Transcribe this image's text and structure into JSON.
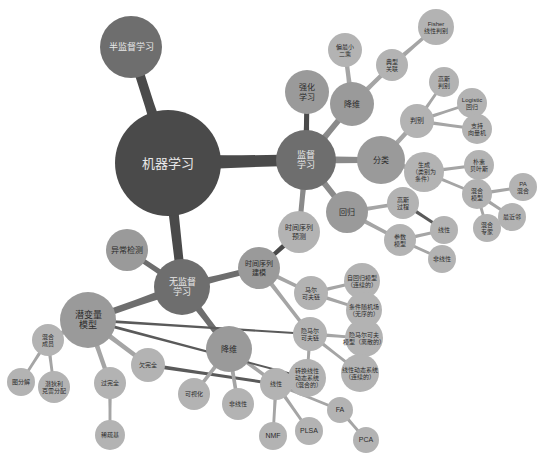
{
  "diagram": {
    "type": "mind-map",
    "title": "机器学习",
    "colors": {
      "background": "#ffffff",
      "root_fill": "#4a4a4a",
      "level1_fill": "#6e6e6e",
      "level2_fill": "#9a9a9a",
      "level3_fill": "#b3b3b3",
      "leaf_fill": "#bdbdbd",
      "link_dark": "#4a4a4a",
      "link_mid": "#8a8a8a",
      "link_light": "#b3b3b3",
      "label_dark": "#2b2b2b",
      "label_light": "#e8e8e8"
    },
    "nodes": [
      {
        "id": "ml",
        "label": "机器学习",
        "x": 168,
        "y": 163,
        "r": 53,
        "fill": "#4a4a4a",
        "text": "#e8e8e8",
        "fontsize": 13,
        "lines": [
          "机器学习"
        ]
      },
      {
        "id": "semi",
        "label": "半监督学习",
        "x": 131,
        "y": 47,
        "r": 31,
        "fill": "#6e6e6e",
        "text": "#e8e8e8",
        "fontsize": 9,
        "lines": [
          "半监督学习"
        ]
      },
      {
        "id": "sup",
        "label": "监督学习",
        "x": 306,
        "y": 160,
        "r": 30,
        "fill": "#6e6e6e",
        "text": "#e8e8e8",
        "fontsize": 9,
        "lines": [
          "监督",
          "学习"
        ]
      },
      {
        "id": "unsup",
        "label": "无监督学习",
        "x": 182,
        "y": 287,
        "r": 28,
        "fill": "#6e6e6e",
        "text": "#e8e8e8",
        "fontsize": 9,
        "lines": [
          "无监督",
          "学习"
        ]
      },
      {
        "id": "rl",
        "label": "强化学习",
        "x": 307,
        "y": 92,
        "r": 22,
        "fill": "#9a9a9a",
        "text": "#2b2b2b",
        "fontsize": 8,
        "lines": [
          "强化",
          "学习"
        ]
      },
      {
        "id": "anomaly",
        "label": "异常检测",
        "x": 127,
        "y": 250,
        "r": 21,
        "fill": "#9a9a9a",
        "text": "#2b2b2b",
        "fontsize": 8,
        "lines": [
          "异常检测"
        ]
      },
      {
        "id": "latent",
        "label": "潜变量模型",
        "x": 88,
        "y": 320,
        "r": 28,
        "fill": "#9a9a9a",
        "text": "#2b2b2b",
        "fontsize": 9,
        "lines": [
          "潜变量",
          "模型"
        ]
      },
      {
        "id": "dimred_sup",
        "label": "降维",
        "x": 352,
        "y": 104,
        "r": 22,
        "fill": "#9a9a9a",
        "text": "#2b2b2b",
        "fontsize": 8,
        "lines": [
          "降维"
        ]
      },
      {
        "id": "classify",
        "label": "分类",
        "x": 381,
        "y": 160,
        "r": 24,
        "fill": "#9a9a9a",
        "text": "#2b2b2b",
        "fontsize": 8,
        "lines": [
          "分类"
        ]
      },
      {
        "id": "regress",
        "label": "回归",
        "x": 347,
        "y": 212,
        "r": 21,
        "fill": "#9a9a9a",
        "text": "#2b2b2b",
        "fontsize": 8,
        "lines": [
          "回归"
        ]
      },
      {
        "id": "tsmodel",
        "label": "时间序列建模",
        "x": 259,
        "y": 268,
        "r": 21,
        "fill": "#9a9a9a",
        "text": "#2b2b2b",
        "fontsize": 7,
        "lines": [
          "时间序列",
          "建模"
        ]
      },
      {
        "id": "tsforecast",
        "label": "时间序列预测",
        "x": 299,
        "y": 232,
        "r": 21,
        "fill": "#b3b3b3",
        "text": "#2b2b2b",
        "fontsize": 7,
        "lines": [
          "时间序列",
          "预测"
        ]
      },
      {
        "id": "dimred_un",
        "label": "降维",
        "x": 229,
        "y": 349,
        "r": 23,
        "fill": "#9a9a9a",
        "text": "#2b2b2b",
        "fontsize": 8,
        "lines": [
          "降维"
        ]
      },
      {
        "id": "pls",
        "label": "偏最小二乘",
        "x": 345,
        "y": 50,
        "r": 17,
        "fill": "#b3b3b3",
        "text": "#2b2b2b",
        "fontsize": 6,
        "lines": [
          "偏最小",
          "二乘"
        ]
      },
      {
        "id": "cca",
        "label": "典型关联",
        "x": 392,
        "y": 65,
        "r": 16,
        "fill": "#b3b3b3",
        "text": "#2b2b2b",
        "fontsize": 6,
        "lines": [
          "典型",
          "关联"
        ]
      },
      {
        "id": "fisher",
        "label": "Fisher线性判别",
        "x": 436,
        "y": 27,
        "r": 18,
        "fill": "#b3b3b3",
        "text": "#2b2b2b",
        "fontsize": 6,
        "lines": [
          "Fisher",
          "线性判别"
        ]
      },
      {
        "id": "discrim",
        "label": "判别",
        "x": 417,
        "y": 121,
        "r": 17,
        "fill": "#b3b3b3",
        "text": "#2b2b2b",
        "fontsize": 7,
        "lines": [
          "判别"
        ]
      },
      {
        "id": "gauss_disc",
        "label": "高斯判别",
        "x": 444,
        "y": 82,
        "r": 15,
        "fill": "#b3b3b3",
        "text": "#2b2b2b",
        "fontsize": 6,
        "lines": [
          "高斯",
          "判别"
        ]
      },
      {
        "id": "logistic",
        "label": "Logistic回归",
        "x": 472,
        "y": 103,
        "r": 15,
        "fill": "#b3b3b3",
        "text": "#2b2b2b",
        "fontsize": 6,
        "lines": [
          "Logistic",
          "回归"
        ]
      },
      {
        "id": "svm",
        "label": "支持向量机",
        "x": 477,
        "y": 129,
        "r": 15,
        "fill": "#b3b3b3",
        "text": "#2b2b2b",
        "fontsize": 6,
        "lines": [
          "支持",
          "向量机"
        ]
      },
      {
        "id": "generate",
        "label": "生成(类别为条件)",
        "x": 424,
        "y": 172,
        "r": 20,
        "fill": "#b3b3b3",
        "text": "#2b2b2b",
        "fontsize": 6,
        "lines": [
          "生成",
          "（类别为",
          "条件）"
        ]
      },
      {
        "id": "naivebayes",
        "label": "朴素贝叶斯",
        "x": 479,
        "y": 165,
        "r": 15,
        "fill": "#b3b3b3",
        "text": "#2b2b2b",
        "fontsize": 6,
        "lines": [
          "朴素",
          "贝叶斯"
        ]
      },
      {
        "id": "mixmodel",
        "label": "混合模型",
        "x": 477,
        "y": 194,
        "r": 15,
        "fill": "#b3b3b3",
        "text": "#2b2b2b",
        "fontsize": 6,
        "lines": [
          "混合",
          "模型"
        ]
      },
      {
        "id": "pamix",
        "label": "PA混合",
        "x": 523,
        "y": 187,
        "r": 14,
        "fill": "#b3b3b3",
        "text": "#2b2b2b",
        "fontsize": 6,
        "lines": [
          "PA",
          "混合"
        ]
      },
      {
        "id": "nearest",
        "label": "最近邻",
        "x": 512,
        "y": 217,
        "r": 14,
        "fill": "#b3b3b3",
        "text": "#2b2b2b",
        "fontsize": 6,
        "lines": [
          "最近邻"
        ]
      },
      {
        "id": "moe",
        "label": "混合专家",
        "x": 487,
        "y": 228,
        "r": 14,
        "fill": "#b3b3b3",
        "text": "#2b2b2b",
        "fontsize": 6,
        "lines": [
          "混合",
          "专家"
        ]
      },
      {
        "id": "gp",
        "label": "高斯过程",
        "x": 403,
        "y": 203,
        "r": 16,
        "fill": "#b3b3b3",
        "text": "#2b2b2b",
        "fontsize": 6,
        "lines": [
          "高斯",
          "过程"
        ]
      },
      {
        "id": "param",
        "label": "参数模型",
        "x": 400,
        "y": 240,
        "r": 16,
        "fill": "#b3b3b3",
        "text": "#2b2b2b",
        "fontsize": 6,
        "lines": [
          "参数",
          "模型"
        ]
      },
      {
        "id": "linear_r",
        "label": "线性",
        "x": 444,
        "y": 230,
        "r": 14,
        "fill": "#b3b3b3",
        "text": "#2b2b2b",
        "fontsize": 6,
        "lines": [
          "线性"
        ]
      },
      {
        "id": "nonlinear_r",
        "label": "非线性",
        "x": 442,
        "y": 259,
        "r": 14,
        "fill": "#b3b3b3",
        "text": "#2b2b2b",
        "fontsize": 6,
        "lines": [
          "非线性"
        ]
      },
      {
        "id": "markov",
        "label": "马尔可夫链",
        "x": 311,
        "y": 293,
        "r": 17,
        "fill": "#b3b3b3",
        "text": "#2b2b2b",
        "fontsize": 6,
        "lines": [
          "马尔",
          "可夫链"
        ]
      },
      {
        "id": "ar",
        "label": "自回归模型（连续的）",
        "x": 362,
        "y": 281,
        "r": 18,
        "fill": "#b3b3b3",
        "text": "#2b2b2b",
        "fontsize": 6,
        "lines": [
          "自回归模型",
          "（连续的）"
        ]
      },
      {
        "id": "crf",
        "label": "条件随机场（无序的）",
        "x": 364,
        "y": 310,
        "r": 18,
        "fill": "#b3b3b3",
        "text": "#2b2b2b",
        "fontsize": 6,
        "lines": [
          "条件随机场",
          "（无序的）"
        ]
      },
      {
        "id": "hiddenmarkov",
        "label": "隐马尔可夫",
        "x": 310,
        "y": 334,
        "r": 17,
        "fill": "#b3b3b3",
        "text": "#2b2b2b",
        "fontsize": 6,
        "lines": [
          "隐马尔",
          "可夫链"
        ]
      },
      {
        "id": "hmm",
        "label": "隐马尔可夫模型（离散的）",
        "x": 364,
        "y": 338,
        "r": 19,
        "fill": "#b3b3b3",
        "text": "#2b2b2b",
        "fontsize": 6,
        "lines": [
          "隐马尔可夫",
          "模型（离散的）"
        ]
      },
      {
        "id": "lds",
        "label": "线性动态系统（连续的）",
        "x": 360,
        "y": 373,
        "r": 19,
        "fill": "#b3b3b3",
        "text": "#2b2b2b",
        "fontsize": 6,
        "lines": [
          "线性动态系统",
          "（连续的）"
        ]
      },
      {
        "id": "slds",
        "label": "转换线性动态系统（混合的）",
        "x": 307,
        "y": 378,
        "r": 19,
        "fill": "#b3b3b3",
        "text": "#2b2b2b",
        "fontsize": 6,
        "lines": [
          "转换线性",
          "动态系统",
          "（混合的）"
        ]
      },
      {
        "id": "mixmember",
        "label": "混合成员",
        "x": 48,
        "y": 340,
        "r": 16,
        "fill": "#b3b3b3",
        "text": "#2b2b2b",
        "fontsize": 6,
        "lines": [
          "混合",
          "成员"
        ]
      },
      {
        "id": "graphfac",
        "label": "图分解",
        "x": 21,
        "y": 382,
        "r": 14,
        "fill": "#b3b3b3",
        "text": "#2b2b2b",
        "fontsize": 6,
        "lines": [
          "图分解"
        ]
      },
      {
        "id": "lda",
        "label": "潜狄利克雷分配",
        "x": 54,
        "y": 387,
        "r": 16,
        "fill": "#b3b3b3",
        "text": "#2b2b2b",
        "fontsize": 6,
        "lines": [
          "潜狄利",
          "克雷分配"
        ]
      },
      {
        "id": "overcomplete",
        "label": "过完全",
        "x": 110,
        "y": 383,
        "r": 16,
        "fill": "#b3b3b3",
        "text": "#2b2b2b",
        "fontsize": 6,
        "lines": [
          "过完全"
        ]
      },
      {
        "id": "sparsebasis",
        "label": "稀疏基",
        "x": 110,
        "y": 435,
        "r": 15,
        "fill": "#b3b3b3",
        "text": "#2b2b2b",
        "fontsize": 6,
        "lines": [
          "稀疏基"
        ]
      },
      {
        "id": "undercomplete",
        "label": "欠完全",
        "x": 148,
        "y": 365,
        "r": 17,
        "fill": "#b3b3b3",
        "text": "#2b2b2b",
        "fontsize": 6,
        "lines": [
          "欠完全"
        ]
      },
      {
        "id": "visualize",
        "label": "可视化",
        "x": 194,
        "y": 394,
        "r": 16,
        "fill": "#b3b3b3",
        "text": "#2b2b2b",
        "fontsize": 6,
        "lines": [
          "可视化"
        ]
      },
      {
        "id": "nonlinear_d",
        "label": "非线性",
        "x": 238,
        "y": 404,
        "r": 16,
        "fill": "#b3b3b3",
        "text": "#2b2b2b",
        "fontsize": 6,
        "lines": [
          "非线性"
        ]
      },
      {
        "id": "linear_d",
        "label": "线性",
        "x": 276,
        "y": 384,
        "r": 16,
        "fill": "#b3b3b3",
        "text": "#2b2b2b",
        "fontsize": 6,
        "lines": [
          "线性"
        ]
      },
      {
        "id": "nmf",
        "label": "NMF",
        "x": 273,
        "y": 436,
        "r": 14,
        "fill": "#b3b3b3",
        "text": "#2b2b2b",
        "fontsize": 7,
        "lines": [
          "NMF"
        ]
      },
      {
        "id": "plsa",
        "label": "PLSA",
        "x": 309,
        "y": 431,
        "r": 14,
        "fill": "#b3b3b3",
        "text": "#2b2b2b",
        "fontsize": 7,
        "lines": [
          "PLSA"
        ]
      },
      {
        "id": "fa",
        "label": "FA",
        "x": 340,
        "y": 410,
        "r": 13,
        "fill": "#b3b3b3",
        "text": "#2b2b2b",
        "fontsize": 7,
        "lines": [
          "FA"
        ]
      },
      {
        "id": "pca",
        "label": "PCA",
        "x": 366,
        "y": 440,
        "r": 13,
        "fill": "#b3b3b3",
        "text": "#2b2b2b",
        "fontsize": 7,
        "lines": [
          "PCA"
        ]
      }
    ],
    "edges": [
      {
        "from": "ml",
        "to": "semi",
        "w": 13,
        "color": "#4a4a4a"
      },
      {
        "from": "ml",
        "to": "sup",
        "w": 17,
        "color": "#4a4a4a"
      },
      {
        "from": "ml",
        "to": "unsup",
        "w": 13,
        "color": "#4a4a4a"
      },
      {
        "from": "sup",
        "to": "rl",
        "w": 7,
        "color": "#4a4a4a"
      },
      {
        "from": "unsup",
        "to": "anomaly",
        "w": 7,
        "color": "#6e6e6e"
      },
      {
        "from": "unsup",
        "to": "latent",
        "w": 9,
        "color": "#6e6e6e"
      },
      {
        "from": "unsup",
        "to": "tsmodel",
        "w": 8,
        "color": "#6e6e6e"
      },
      {
        "from": "unsup",
        "to": "dimred_un",
        "w": 8,
        "color": "#6e6e6e"
      },
      {
        "from": "sup",
        "to": "dimred_sup",
        "w": 8,
        "color": "#8a8a8a"
      },
      {
        "from": "sup",
        "to": "classify",
        "w": 9,
        "color": "#8a8a8a"
      },
      {
        "from": "sup",
        "to": "regress",
        "w": 8,
        "color": "#8a8a8a"
      },
      {
        "from": "sup",
        "to": "tsforecast",
        "w": 7,
        "color": "#8a8a8a"
      },
      {
        "from": "dimred_sup",
        "to": "pls",
        "w": 6,
        "color": "#a5a5a5"
      },
      {
        "from": "dimred_sup",
        "to": "cca",
        "w": 6,
        "color": "#a5a5a5"
      },
      {
        "from": "cca",
        "to": "fisher",
        "w": 5,
        "color": "#a5a5a5"
      },
      {
        "from": "classify",
        "to": "discrim",
        "w": 6,
        "color": "#a5a5a5"
      },
      {
        "from": "discrim",
        "to": "gauss_disc",
        "w": 4,
        "color": "#a5a5a5"
      },
      {
        "from": "discrim",
        "to": "logistic",
        "w": 4,
        "color": "#a5a5a5"
      },
      {
        "from": "discrim",
        "to": "svm",
        "w": 4,
        "color": "#a5a5a5"
      },
      {
        "from": "classify",
        "to": "generate",
        "w": 6,
        "color": "#a5a5a5"
      },
      {
        "from": "generate",
        "to": "naivebayes",
        "w": 4,
        "color": "#a5a5a5"
      },
      {
        "from": "generate",
        "to": "mixmodel",
        "w": 4,
        "color": "#a5a5a5"
      },
      {
        "from": "mixmodel",
        "to": "pamix",
        "w": 4,
        "color": "#a5a5a5"
      },
      {
        "from": "mixmodel",
        "to": "nearest",
        "w": 4,
        "color": "#a5a5a5"
      },
      {
        "from": "mixmodel",
        "to": "moe",
        "w": 4,
        "color": "#a5a5a5"
      },
      {
        "from": "regress",
        "to": "gp",
        "w": 5,
        "color": "#a5a5a5"
      },
      {
        "from": "regress",
        "to": "param",
        "w": 5,
        "color": "#a5a5a5"
      },
      {
        "from": "gp",
        "to": "linear_r",
        "w": 4,
        "color": "#5a5a5a"
      },
      {
        "from": "param",
        "to": "linear_r",
        "w": 4,
        "color": "#a5a5a5"
      },
      {
        "from": "param",
        "to": "nonlinear_r",
        "w": 4,
        "color": "#a5a5a5"
      },
      {
        "from": "tsforecast",
        "to": "tsmodel",
        "w": 6,
        "color": "#4a4a4a"
      },
      {
        "from": "tsmodel",
        "to": "markov",
        "w": 5,
        "color": "#a5a5a5"
      },
      {
        "from": "markov",
        "to": "ar",
        "w": 4,
        "color": "#a5a5a5"
      },
      {
        "from": "markov",
        "to": "crf",
        "w": 4,
        "color": "#a5a5a5"
      },
      {
        "from": "tsmodel",
        "to": "hiddenmarkov",
        "w": 5,
        "color": "#a5a5a5"
      },
      {
        "from": "hiddenmarkov",
        "to": "hmm",
        "w": 4,
        "color": "#a5a5a5"
      },
      {
        "from": "hiddenmarkov",
        "to": "lds",
        "w": 4,
        "color": "#a5a5a5"
      },
      {
        "from": "hiddenmarkov",
        "to": "slds",
        "w": 4,
        "color": "#a5a5a5"
      },
      {
        "from": "latent",
        "to": "mixmember",
        "w": 6,
        "color": "#a5a5a5"
      },
      {
        "from": "mixmember",
        "to": "graphfac",
        "w": 4,
        "color": "#a5a5a5"
      },
      {
        "from": "mixmember",
        "to": "lda",
        "w": 4,
        "color": "#a5a5a5"
      },
      {
        "from": "latent",
        "to": "overcomplete",
        "w": 6,
        "color": "#a5a5a5"
      },
      {
        "from": "overcomplete",
        "to": "sparsebasis",
        "w": 4,
        "color": "#a5a5a5"
      },
      {
        "from": "latent",
        "to": "undercomplete",
        "w": 6,
        "color": "#a5a5a5"
      },
      {
        "from": "undercomplete",
        "to": "linear_d",
        "w": 4,
        "color": "#5a5a5a"
      },
      {
        "from": "dimred_un",
        "to": "visualize",
        "w": 5,
        "color": "#a5a5a5"
      },
      {
        "from": "dimred_un",
        "to": "nonlinear_d",
        "w": 5,
        "color": "#a5a5a5"
      },
      {
        "from": "dimred_un",
        "to": "linear_d",
        "w": 5,
        "color": "#a5a5a5"
      },
      {
        "from": "linear_d",
        "to": "nmf",
        "w": 4,
        "color": "#a5a5a5"
      },
      {
        "from": "linear_d",
        "to": "plsa",
        "w": 4,
        "color": "#a5a5a5"
      },
      {
        "from": "linear_d",
        "to": "fa",
        "w": 4,
        "color": "#a5a5a5"
      },
      {
        "from": "fa",
        "to": "pca",
        "w": 4,
        "color": "#a5a5a5"
      },
      {
        "from": "latent",
        "to": "slds",
        "w": 3,
        "color": "#5a5a5a"
      },
      {
        "from": "latent",
        "to": "hiddenmarkov",
        "w": 3,
        "color": "#5a5a5a"
      }
    ]
  }
}
